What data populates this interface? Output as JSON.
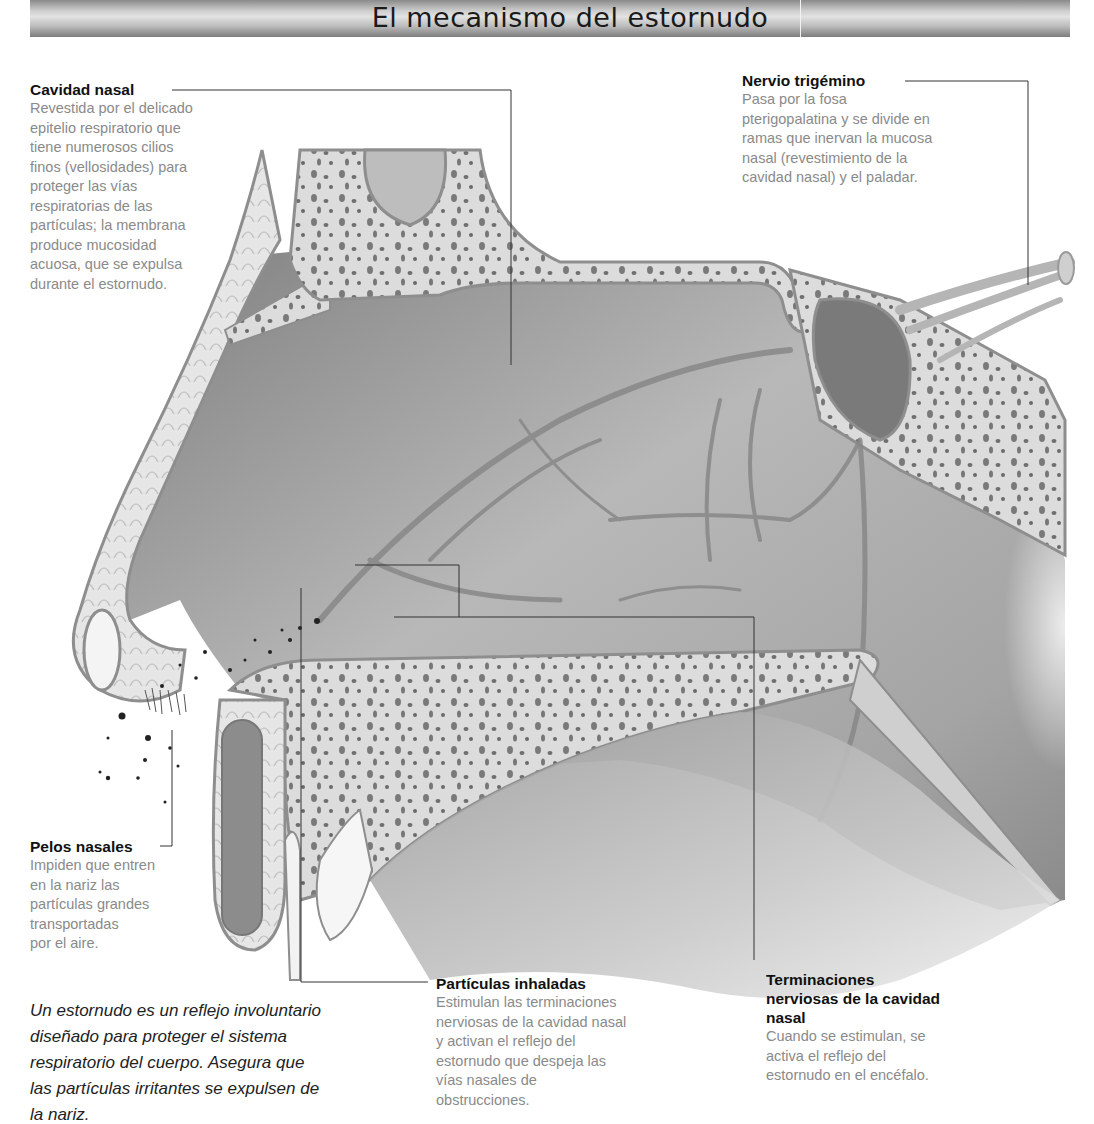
{
  "title": "El mecanismo del estornudo",
  "labels": {
    "cavidad_nasal": {
      "heading": "Cavidad nasal",
      "lines": [
        "Revestida por el delicado",
        "epitelio respiratorio que",
        "tiene numerosos cilios",
        "finos (vellosidades) para",
        "proteger las vías",
        "respiratorias de las",
        "partículas; la membrana",
        "produce mucosidad",
        "acuosa, que se expulsa",
        "durante el estornudo."
      ]
    },
    "nervio_trigemino": {
      "heading": "Nervio trigémino",
      "lines": [
        "Pasa por la fosa",
        "pterigopalatina y se divide en",
        "ramas que inervan la mucosa",
        "nasal (revestimiento de la",
        "cavidad nasal) y el paladar."
      ]
    },
    "pelos_nasales": {
      "heading": "Pelos nasales",
      "lines": [
        "Impiden que entren",
        "en la nariz las",
        "partículas grandes",
        "transportadas",
        "por el aire."
      ]
    },
    "particulas_inhaladas": {
      "heading": "Partículas inhaladas",
      "lines": [
        "Estimulan las terminaciones",
        "nerviosas de la cavidad nasal",
        "y activan el reflejo del",
        "estornudo que despeja las",
        "vías nasales de",
        "obstrucciones."
      ]
    },
    "terminaciones": {
      "heading_lines": [
        "Terminaciones",
        "nerviosas de la cavidad",
        "nasal"
      ],
      "lines": [
        "Cuando se estimulan, se",
        "activa el reflejo del",
        "estornudo en el encéfalo."
      ]
    }
  },
  "caption_lines": [
    "Un estornudo es un reflejo involuntario",
    "diseñado para proteger el sistema",
    "respiratorio del cuerpo. Asegura que",
    "las partículas irritantes se expulsen de",
    "la nariz."
  ],
  "colors": {
    "bone": "#d9d9d9",
    "cavity": "#a9a9a9",
    "nerve": "#8c8c8c",
    "leader": "#333333"
  }
}
